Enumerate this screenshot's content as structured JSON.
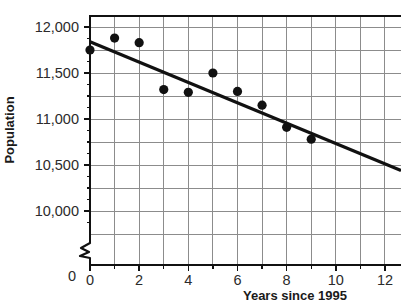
{
  "chart_data": {
    "type": "scatter",
    "title": "",
    "xlabel": "Years since 1995",
    "ylabel": "Population",
    "xlim": [
      0,
      13
    ],
    "ylim": [
      9750,
      12125
    ],
    "y_axis_break": true,
    "y_axis_zero_label": "0",
    "grid": true,
    "grid_minor_y_step": 250,
    "grid_minor_x_step": 1,
    "legend": "none",
    "x": [
      0,
      1,
      2,
      3,
      4,
      5,
      6,
      7,
      8,
      9
    ],
    "values": [
      11750,
      11880,
      11830,
      11320,
      11290,
      11500,
      11300,
      11150,
      10910,
      10780
    ],
    "points": [
      {
        "x": 0,
        "y": 11750
      },
      {
        "x": 1,
        "y": 11880
      },
      {
        "x": 2,
        "y": 11830
      },
      {
        "x": 3,
        "y": 11320
      },
      {
        "x": 4,
        "y": 11290
      },
      {
        "x": 5,
        "y": 11500
      },
      {
        "x": 6,
        "y": 11300
      },
      {
        "x": 7,
        "y": 11150
      },
      {
        "x": 8,
        "y": 10910
      },
      {
        "x": 9,
        "y": 10780
      }
    ],
    "trendline": {
      "x_start": 0,
      "y_start": 11840,
      "x_end": 13,
      "y_end": 10440
    },
    "xticks": [
      {
        "value": 0,
        "label": "0"
      },
      {
        "value": 2,
        "label": "2"
      },
      {
        "value": 4,
        "label": "4"
      },
      {
        "value": 6,
        "label": "6"
      },
      {
        "value": 8,
        "label": "8"
      },
      {
        "value": 10,
        "label": "10"
      },
      {
        "value": 12,
        "label": "12"
      }
    ],
    "xticks_minor": [
      1,
      3,
      5,
      7,
      9,
      11,
      13
    ],
    "yticks": [
      {
        "value": 10000,
        "label": "10,000"
      },
      {
        "value": 10500,
        "label": "10,500"
      },
      {
        "value": 11000,
        "label": "11,000"
      },
      {
        "value": 11500,
        "label": "11,500"
      },
      {
        "value": 12000,
        "label": "12,000"
      }
    ],
    "yticks_minor": [
      9875,
      10125,
      10250,
      10375,
      10625,
      10750,
      10875,
      11125,
      11250,
      11375,
      11625,
      11750,
      11875
    ],
    "colors": {
      "point": "#111111",
      "trendline": "#111111",
      "grid": "#8c8c8c",
      "axis": "#111111",
      "text": "#2b2b2b",
      "background": "#ffffff"
    }
  },
  "axis_titles": {
    "x": "Years since 1995",
    "y": "Population"
  },
  "y_zero": {
    "label": "0"
  }
}
